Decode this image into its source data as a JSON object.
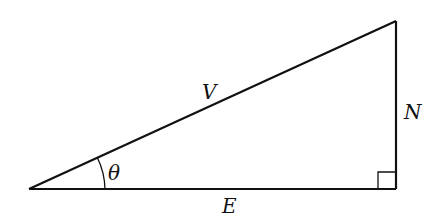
{
  "diagram": {
    "type": "right-triangle",
    "colors": {
      "stroke": "#111111",
      "background": "#ffffff"
    },
    "labels": {
      "hypotenuse": "V",
      "vertical_side": "N",
      "base": "E",
      "angle": "θ"
    }
  }
}
